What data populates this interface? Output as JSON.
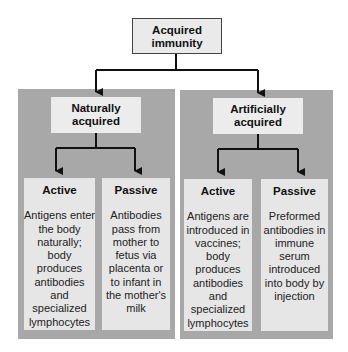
{
  "root": {
    "label_line1": "Acquired",
    "label_line2": "immunity"
  },
  "branches": [
    {
      "label_line1": "Naturally",
      "label_line2": "acquired",
      "children": [
        {
          "title": "Active",
          "lines": [
            "Antigens enter",
            "the body",
            "naturally;",
            "body",
            "produces",
            "antibodies",
            "and",
            "specialized",
            "lymphocytes"
          ]
        },
        {
          "title": "Passive",
          "lines": [
            "Antibodies",
            "pass from",
            "mother to",
            "fetus via",
            "placenta or",
            "to infant in",
            "the mother's",
            "milk"
          ]
        }
      ]
    },
    {
      "label_line1": "Artificially",
      "label_line2": "acquired",
      "children": [
        {
          "title": "Active",
          "lines": [
            "Antigens are",
            "introduced in",
            "vaccines;",
            "body",
            "produces",
            "antibodies",
            "and",
            "specialized",
            "lymphocytes"
          ]
        },
        {
          "title": "Passive",
          "lines": [
            "Preformed",
            "antibodies in",
            "immune",
            "serum",
            "introduced",
            "into body by",
            "injection"
          ]
        }
      ]
    }
  ],
  "colors": {
    "panel": "#a8a8a8",
    "box": "#ececec",
    "arrow": "#111111"
  }
}
